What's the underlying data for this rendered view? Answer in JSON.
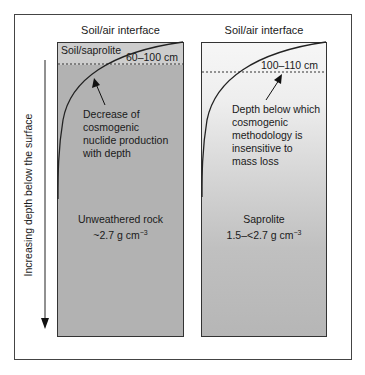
{
  "figure": {
    "axis_label": "Increasing depth below the surface",
    "left_panel": {
      "header": "Soil/air interface",
      "zone_label": "Soil/saprolite",
      "depth_label": "60–100 cm",
      "annotation": [
        "Decrease of",
        "cosmogenic",
        "nuclide production",
        "with depth"
      ],
      "material": "Unweathered rock",
      "density": "~2.7 g cm",
      "density_exp": "−3",
      "fill_color": "#b2b2b2",
      "soil_zone_color": "#cdcdcd"
    },
    "right_panel": {
      "header": "Soil/air interface",
      "depth_label": "100–110 cm",
      "annotation": [
        "Depth below which",
        "cosmogenic",
        "methodology is",
        "insensitive to",
        "mass loss"
      ],
      "material": "Saprolite",
      "density": "1.5–<2.7 g cm",
      "density_exp": "−3",
      "gradient_top": "#f6f6f6",
      "gradient_bottom": "#b6b6b6"
    }
  }
}
